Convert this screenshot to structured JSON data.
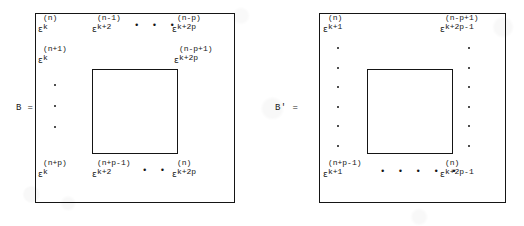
{
  "figure": {
    "kind": "matrix-definition-figure",
    "matrices": [
      {
        "id": "B",
        "equation_label": "B =",
        "corners": {
          "top_left": {
            "symbol": "ε",
            "superscript": "(n)",
            "subscript": "k"
          },
          "top_right": {
            "symbol": "ε",
            "superscript": "(n-p)",
            "subscript": "k+2p"
          },
          "second_row_left": {
            "symbol": "ε",
            "superscript": "(n+1)",
            "subscript": "k"
          },
          "second_row_right": {
            "symbol": "ε",
            "superscript": "(n-p+1)",
            "subscript": "k+2p"
          },
          "bottom_left": {
            "symbol": "ε",
            "superscript": "(n+p)",
            "subscript": "k"
          },
          "bottom_second": {
            "symbol": "ε",
            "superscript": "(n+p-1)",
            "subscript": "k+2"
          },
          "bottom_right": {
            "symbol": "ε",
            "superscript": "(n)",
            "subscript": "k+2p"
          },
          "top_second": {
            "symbol": "ε",
            "superscript": "(n-1)",
            "subscript": "k+2"
          }
        },
        "ellipses": {
          "top_row": "• • •",
          "bottom_row": "• •",
          "left_column_dots": 3
        }
      },
      {
        "id": "B'",
        "equation_label": "B' =",
        "corners": {
          "top_left": {
            "symbol": "ε",
            "superscript": "(n)",
            "subscript": "k+1"
          },
          "top_right": {
            "symbol": "ε",
            "superscript": "(n-p+1)",
            "subscript": "k+2p-1"
          },
          "bottom_left": {
            "symbol": "ε",
            "superscript": "(n+p-1)",
            "subscript": "k+1"
          },
          "bottom_right": {
            "symbol": "ε",
            "superscript": "(n)",
            "subscript": "k+2p-1"
          }
        },
        "ellipses": {
          "bottom_row": "• • • • •",
          "left_column_dots": 6,
          "right_column_dots": 6
        }
      }
    ]
  }
}
